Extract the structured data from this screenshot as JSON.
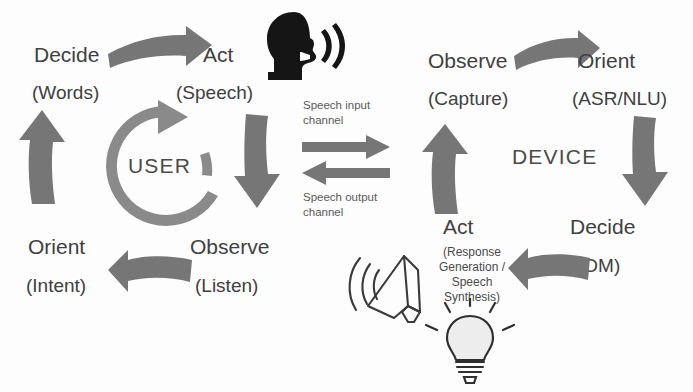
{
  "diagram": {
    "colors": {
      "arrow_gray": "#767676",
      "ring_gray": "#8a8a8a",
      "text_gray": "#404040",
      "icon_black": "#151515",
      "background": "#fdfdfd"
    },
    "user_loop": {
      "center_label": "USER",
      "stages": [
        {
          "name": "Decide",
          "detail": "(Words)"
        },
        {
          "name": "Act",
          "detail": "(Speech)"
        },
        {
          "name": "Observe",
          "detail": "(Listen)"
        },
        {
          "name": "Orient",
          "detail": "(Intent)"
        }
      ]
    },
    "device_loop": {
      "center_label": "DEVICE",
      "stages": [
        {
          "name": "Observe",
          "detail": "(Capture)"
        },
        {
          "name": "Orient",
          "detail": "(ASR/NLU)"
        },
        {
          "name": "Decide",
          "detail": "(DM)"
        },
        {
          "name": "Act",
          "detail": "(Response Generation / Speech Synthesis)"
        }
      ]
    },
    "channels": {
      "input_label_line1": "Speech input",
      "input_label_line2": "channel",
      "output_label_line1": "Speech output",
      "output_label_line2": "channel"
    },
    "act_detail_lines": {
      "line1": "(Response",
      "line2": "Generation /",
      "line3": "Speech",
      "line4": "Synthesis)"
    },
    "icons": {
      "speaking_head": "speaking-head-icon",
      "loudspeaker": "loudspeaker-icon",
      "lightbulb": "lightbulb-icon"
    }
  }
}
